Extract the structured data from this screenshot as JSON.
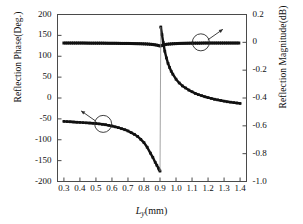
{
  "chart_data": {
    "type": "line",
    "title": "",
    "xlabel": "Ly(mm)",
    "xlabel_parts": {
      "var": "L",
      "sub": "y",
      "unit": "(mm)"
    },
    "ylabel": "Reflection Phase(Deg.)",
    "ylabel_right": "Reflection Magnitude(dB)",
    "xlim": [
      0.26,
      1.44
    ],
    "ylim": [
      -200,
      200
    ],
    "ylim_right": [
      -1.0,
      0.2
    ],
    "xticks": [
      "0.3",
      "0.4",
      "0.5",
      "0.6",
      "0.7",
      "0.8",
      "0.9",
      "1.0",
      "1.1",
      "1.2",
      "1.3",
      "1.4"
    ],
    "xtick_values": [
      0.3,
      0.4,
      0.5,
      0.6,
      0.7,
      0.8,
      0.9,
      1.0,
      1.1,
      1.2,
      1.3,
      1.4
    ],
    "yticks": [
      "200",
      "150",
      "100",
      "50",
      "0",
      "-50",
      "-100",
      "-150",
      "-200"
    ],
    "ytick_values": [
      200,
      150,
      100,
      50,
      0,
      -50,
      -100,
      -150,
      -200
    ],
    "yticks_right": [
      "0.2",
      "0",
      "-0.2",
      "-0.4",
      "-0.6",
      "-0.8",
      "-1.0"
    ],
    "ytick_values_right": [
      0.2,
      0,
      -0.2,
      -0.4,
      -0.6,
      -0.8,
      -1.0
    ],
    "grid": false,
    "legend": "none",
    "marker": "filled-square",
    "series": [
      {
        "name": "Reflection Phase",
        "axis": "left",
        "unit": "Deg.",
        "x": [
          0.3,
          0.32,
          0.34,
          0.36,
          0.38,
          0.4,
          0.42,
          0.44,
          0.46,
          0.48,
          0.5,
          0.52,
          0.54,
          0.56,
          0.58,
          0.6,
          0.62,
          0.64,
          0.66,
          0.68,
          0.7,
          0.72,
          0.74,
          0.76,
          0.78,
          0.8,
          0.82,
          0.84,
          0.855,
          0.87,
          0.88,
          0.89,
          0.895,
          0.9
        ],
        "values": [
          -56,
          -56.5,
          -57,
          -57.5,
          -58,
          -58.5,
          -59,
          -59.5,
          -60,
          -60.5,
          -61,
          -62,
          -63,
          -64,
          -65.5,
          -67,
          -69,
          -71,
          -73.5,
          -76,
          -79,
          -83,
          -87,
          -92,
          -99,
          -107,
          -118,
          -132,
          -142,
          -154,
          -161,
          -168,
          -172,
          -175
        ]
      },
      {
        "name": "Reflection Phase (after wrap)",
        "axis": "left",
        "unit": "Deg.",
        "x": [
          0.905,
          0.912,
          0.92,
          0.93,
          0.94,
          0.95,
          0.96,
          0.97,
          0.98,
          1.0,
          1.02,
          1.04,
          1.06,
          1.08,
          1.1,
          1.12,
          1.14,
          1.16,
          1.18,
          1.2,
          1.22,
          1.24,
          1.26,
          1.28,
          1.3,
          1.32,
          1.34,
          1.36,
          1.38,
          1.4
        ],
        "values": [
          170,
          152,
          133,
          112,
          96,
          83,
          73,
          64,
          57,
          45,
          36,
          29,
          24,
          19,
          15,
          11,
          8,
          5.5,
          3,
          1,
          -1,
          -3,
          -4.5,
          -6,
          -7.5,
          -9,
          -10,
          -11,
          -12,
          -13
        ]
      },
      {
        "name": "Reflection Magnitude",
        "axis": "right",
        "unit": "dB",
        "x": [
          0.3,
          0.34,
          0.38,
          0.42,
          0.46,
          0.5,
          0.54,
          0.58,
          0.62,
          0.66,
          0.7,
          0.74,
          0.78,
          0.82,
          0.86,
          0.88,
          0.9,
          0.92,
          0.94,
          0.98,
          1.02,
          1.06,
          1.1,
          1.14,
          1.18,
          1.22,
          1.26,
          1.3,
          1.34,
          1.38,
          1.4
        ],
        "values": [
          -0.005,
          -0.005,
          -0.005,
          -0.005,
          -0.006,
          -0.006,
          -0.006,
          -0.007,
          -0.007,
          -0.008,
          -0.008,
          -0.009,
          -0.01,
          -0.012,
          -0.016,
          -0.02,
          -0.026,
          -0.02,
          -0.014,
          -0.01,
          -0.008,
          -0.007,
          -0.006,
          -0.006,
          -0.005,
          -0.005,
          -0.005,
          -0.005,
          -0.005,
          -0.005,
          -0.005
        ]
      }
    ],
    "annotations": [
      {
        "name": "phase-callout",
        "shape": "circle-with-arrow",
        "circle_center_x": 0.545,
        "circle_center_y": -62,
        "target_series": "Reflection Phase",
        "arrow_direction": "up-left"
      },
      {
        "name": "magnitude-callout",
        "shape": "circle-with-arrow",
        "circle_center_x": 1.155,
        "circle_center_y": 0,
        "target_series": "Reflection Magnitude",
        "arrow_direction": "up-right"
      }
    ],
    "colors": {
      "trace": "#111111",
      "axis": "#4a4a4a",
      "text": "#101010",
      "background": "#ffffff"
    }
  }
}
